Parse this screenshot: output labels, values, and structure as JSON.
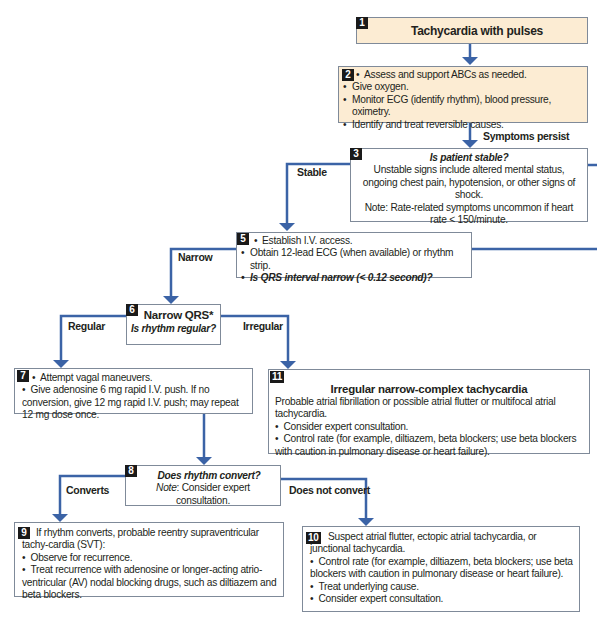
{
  "colors": {
    "connector": "#3b63a6",
    "tan_box": "#fcecd3",
    "border": "#7f8a99",
    "badge": "#1a1a1a"
  },
  "boxes": {
    "b1": {
      "num": "1",
      "title": "Tachycardia with pulses"
    },
    "b2": {
      "num": "2",
      "items": [
        "Assess and support ABCs as needed.",
        "Give oxygen.",
        "Monitor ECG (identify rhythm), blood pressure, oximetry.",
        "Identify and treat reversible causes."
      ]
    },
    "b3": {
      "num": "3",
      "title": "Is patient stable?",
      "line1": "Unstable signs include altered mental status, ongoing chest pain, hypotension, or other signs of shock.",
      "line2": "Note: Rate-related symptoms uncommon if heart rate < 150/minute."
    },
    "b5": {
      "num": "5",
      "items": [
        "Establish I.V. access.",
        "Obtain 12-lead ECG (when available) or rhythm strip.",
        "Is QRS interval narrow (< 0.12 second)?"
      ]
    },
    "b6": {
      "num": "6",
      "title": "Narrow QRS*",
      "subtitle": "Is rhythm regular?"
    },
    "b7": {
      "num": "7",
      "items": [
        "Attempt vagal maneuvers.",
        "Give adenosine 6 mg rapid I.V. push. If no conversion, give 12 mg rapid I.V. push; may repeat 12 mg dose once."
      ]
    },
    "b8": {
      "num": "8",
      "title": "Does rhythm convert?",
      "note_label": "Note",
      "note_text": ": Consider expert consultation."
    },
    "b9": {
      "num": "9",
      "intro": "If rhythm converts, probable reentry supraventricular tachy-cardia (SVT):",
      "items": [
        "Observe for recurrence.",
        "Treat recurrence with adenosine or longer-acting atrio-ventricular (AV) nodal blocking drugs, such as diltiazem and beta blockers."
      ]
    },
    "b10": {
      "num": "10",
      "intro": "Suspect atrial flutter, ectopic atrial tachycardia, or junctional tachycardia.",
      "items": [
        "Control rate (for example, diltiazem, beta blockers; use beta blockers with caution in pulmonary disease or heart failure).",
        "Treat underlying cause.",
        "Consider expert consultation."
      ]
    },
    "b11": {
      "num": "11",
      "title": "Irregular narrow-complex tachycardia",
      "intro": "Probable atrial fibrillation or possible atrial flutter or multifocal atrial tachycardia.",
      "items": [
        "Consider expert consultation.",
        "Control rate (for example, diltiazem, beta blockers; use beta blockers with caution in pulmonary disease or heart failure)."
      ]
    }
  },
  "labels": {
    "symptoms_persist": "Symptoms persist",
    "stable": "Stable",
    "narrow": "Narrow",
    "regular": "Regular",
    "irregular": "Irregular",
    "converts": "Converts",
    "does_not_convert": "Does not convert"
  }
}
